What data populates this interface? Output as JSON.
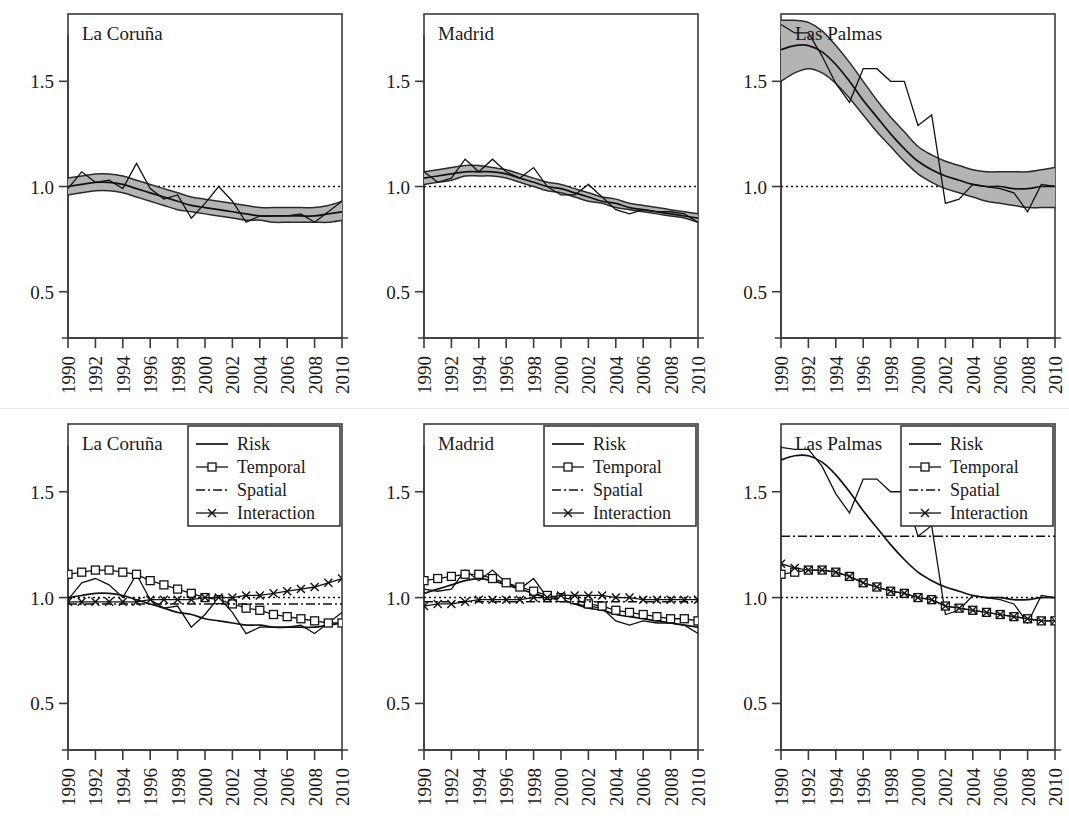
{
  "figure": {
    "width": 1069,
    "height": 830,
    "background": "#ffffff",
    "rows": 2,
    "cols": 3,
    "ink_color": "#111111",
    "band_color": "#b4b4b4",
    "axis_color": "#3b3b3b"
  },
  "axes": {
    "y_ticks": [
      0.5,
      1.0,
      1.5
    ],
    "y_tick_labels": [
      "0.5",
      "1.0",
      "1.5"
    ],
    "ylim": [
      0.28,
      1.82
    ],
    "x_ticks": [
      1990,
      1992,
      1994,
      1996,
      1998,
      2000,
      2002,
      2004,
      2006,
      2008,
      2010
    ],
    "x_tick_labels": [
      "1990",
      "1992",
      "1994",
      "1996",
      "1998",
      "2000",
      "2002",
      "2004",
      "2006",
      "2008",
      "2010"
    ],
    "xlim": [
      1990,
      2010
    ],
    "reference_line": 1.0,
    "grid": false,
    "xlabel": "",
    "ylabel": ""
  },
  "legend": {
    "position": "top-right",
    "visible_in_rows": [
      2
    ],
    "items": [
      {
        "label": "Risk",
        "style": "solid-line",
        "marker": "none"
      },
      {
        "label": "Temporal",
        "style": "solid-line",
        "marker": "square"
      },
      {
        "label": "Spatial",
        "style": "dash-dot-line",
        "marker": "none"
      },
      {
        "label": "Interaction",
        "style": "solid-line",
        "marker": "x"
      }
    ]
  },
  "chart_data": [
    {
      "id": "top-la-coruna",
      "type": "line",
      "title": "La Coruña",
      "row": 1,
      "col": 1,
      "xlabel": "",
      "ylabel": "",
      "ylim": [
        0.28,
        1.82
      ],
      "xlim": [
        1990,
        2010
      ],
      "grid": false,
      "x": [
        1990,
        1991,
        1992,
        1993,
        1994,
        1995,
        1996,
        1997,
        1998,
        1999,
        2000,
        2001,
        2002,
        2003,
        2004,
        2005,
        2006,
        2007,
        2008,
        2009,
        2010
      ],
      "series": [
        {
          "name": "Observed SMR",
          "style": "thin-solid",
          "values": [
            0.99,
            1.07,
            1.02,
            1.03,
            0.99,
            1.11,
            0.99,
            0.94,
            0.96,
            0.85,
            0.92,
            1.0,
            0.93,
            0.83,
            0.86,
            0.86,
            0.86,
            0.87,
            0.83,
            0.88,
            0.93
          ]
        },
        {
          "name": "Smoothed risk",
          "style": "medium-solid",
          "values": [
            1.0,
            1.01,
            1.02,
            1.02,
            1.01,
            0.99,
            0.97,
            0.95,
            0.93,
            0.91,
            0.9,
            0.89,
            0.88,
            0.87,
            0.86,
            0.86,
            0.86,
            0.86,
            0.86,
            0.87,
            0.88
          ]
        }
      ],
      "band": {
        "name": "95% credible interval",
        "fill": "#b4b4b4",
        "lower": [
          0.96,
          0.97,
          0.98,
          0.98,
          0.97,
          0.95,
          0.93,
          0.91,
          0.89,
          0.88,
          0.87,
          0.86,
          0.85,
          0.84,
          0.84,
          0.83,
          0.83,
          0.83,
          0.83,
          0.83,
          0.84
        ],
        "upper": [
          1.04,
          1.05,
          1.06,
          1.06,
          1.05,
          1.03,
          1.01,
          0.99,
          0.97,
          0.95,
          0.94,
          0.93,
          0.92,
          0.91,
          0.9,
          0.9,
          0.9,
          0.9,
          0.9,
          0.91,
          0.93
        ]
      }
    },
    {
      "id": "top-madrid",
      "type": "line",
      "title": "Madrid",
      "row": 1,
      "col": 2,
      "xlabel": "",
      "ylabel": "",
      "ylim": [
        0.28,
        1.82
      ],
      "xlim": [
        1990,
        2010
      ],
      "grid": false,
      "x": [
        1990,
        1991,
        1992,
        1993,
        1994,
        1995,
        1996,
        1997,
        1998,
        1999,
        2000,
        2001,
        2002,
        2003,
        2004,
        2005,
        2006,
        2007,
        2008,
        2009,
        2010
      ],
      "series": [
        {
          "name": "Observed SMR",
          "style": "thin-solid",
          "values": [
            1.07,
            1.02,
            1.04,
            1.13,
            1.07,
            1.13,
            1.07,
            1.04,
            1.09,
            1.0,
            0.96,
            0.96,
            1.01,
            0.95,
            0.89,
            0.87,
            0.89,
            0.88,
            0.88,
            0.87,
            0.83
          ]
        },
        {
          "name": "Smoothed risk",
          "style": "medium-solid",
          "values": [
            1.04,
            1.05,
            1.06,
            1.07,
            1.07,
            1.07,
            1.06,
            1.04,
            1.02,
            1.0,
            0.99,
            0.97,
            0.95,
            0.93,
            0.92,
            0.9,
            0.89,
            0.88,
            0.87,
            0.86,
            0.85
          ]
        }
      ],
      "band": {
        "name": "95% credible interval",
        "fill": "#b4b4b4",
        "lower": [
          1.01,
          1.02,
          1.03,
          1.05,
          1.05,
          1.05,
          1.04,
          1.02,
          1.0,
          0.98,
          0.97,
          0.95,
          0.93,
          0.92,
          0.9,
          0.89,
          0.88,
          0.87,
          0.86,
          0.85,
          0.83
        ],
        "upper": [
          1.07,
          1.08,
          1.09,
          1.1,
          1.1,
          1.09,
          1.08,
          1.06,
          1.04,
          1.02,
          1.01,
          0.99,
          0.97,
          0.95,
          0.94,
          0.92,
          0.91,
          0.9,
          0.89,
          0.88,
          0.87
        ]
      }
    },
    {
      "id": "top-las-palmas",
      "type": "line",
      "title": "Las Palmas",
      "row": 1,
      "col": 3,
      "xlabel": "",
      "ylabel": "",
      "ylim": [
        0.28,
        1.82
      ],
      "xlim": [
        1990,
        2010
      ],
      "grid": false,
      "x": [
        1990,
        1991,
        1992,
        1993,
        1994,
        1995,
        1996,
        1997,
        1998,
        1999,
        2000,
        2001,
        2002,
        2003,
        2004,
        2005,
        2006,
        2007,
        2008,
        2009,
        2010
      ],
      "series": [
        {
          "name": "Observed SMR",
          "style": "thin-solid",
          "values": [
            1.77,
            1.73,
            1.73,
            1.62,
            1.49,
            1.4,
            1.56,
            1.56,
            1.5,
            1.5,
            1.29,
            1.34,
            0.92,
            0.94,
            1.01,
            1.0,
            0.99,
            0.97,
            0.88,
            1.01,
            1.0
          ]
        },
        {
          "name": "Smoothed risk",
          "style": "medium-solid",
          "values": [
            1.65,
            1.67,
            1.67,
            1.64,
            1.58,
            1.5,
            1.41,
            1.33,
            1.25,
            1.18,
            1.12,
            1.08,
            1.05,
            1.03,
            1.01,
            1.0,
            1.0,
            0.99,
            0.99,
            1.0,
            1.0
          ]
        }
      ],
      "band": {
        "name": "95% credible interval",
        "fill": "#b4b4b4",
        "lower": [
          1.5,
          1.54,
          1.56,
          1.54,
          1.49,
          1.42,
          1.34,
          1.26,
          1.19,
          1.12,
          1.06,
          1.02,
          0.99,
          0.97,
          0.95,
          0.93,
          0.92,
          0.91,
          0.9,
          0.9,
          0.9
        ],
        "upper": [
          1.79,
          1.79,
          1.78,
          1.74,
          1.67,
          1.59,
          1.5,
          1.41,
          1.33,
          1.26,
          1.19,
          1.15,
          1.12,
          1.1,
          1.08,
          1.07,
          1.07,
          1.07,
          1.07,
          1.08,
          1.09
        ]
      }
    },
    {
      "id": "bottom-la-coruna",
      "type": "line",
      "title": "La Coruña",
      "row": 2,
      "col": 1,
      "xlabel": "",
      "ylabel": "",
      "ylim": [
        0.28,
        1.82
      ],
      "xlim": [
        1990,
        2010
      ],
      "grid": false,
      "legend": true,
      "x": [
        1990,
        1991,
        1992,
        1993,
        1994,
        1995,
        1996,
        1997,
        1998,
        1999,
        2000,
        2001,
        2002,
        2003,
        2004,
        2005,
        2006,
        2007,
        2008,
        2009,
        2010
      ],
      "series": [
        {
          "name": "Observed SMR",
          "style": "thin-solid",
          "values": [
            0.99,
            1.07,
            1.09,
            1.06,
            1.0,
            1.11,
            0.99,
            0.95,
            0.96,
            0.86,
            0.92,
            1.0,
            0.93,
            0.83,
            0.86,
            0.86,
            0.86,
            0.87,
            0.83,
            0.88,
            0.93
          ]
        },
        {
          "name": "Risk",
          "style": "medium-solid",
          "values": [
            1.0,
            1.01,
            1.02,
            1.02,
            1.01,
            0.99,
            0.97,
            0.95,
            0.93,
            0.92,
            0.9,
            0.89,
            0.88,
            0.87,
            0.87,
            0.86,
            0.86,
            0.86,
            0.86,
            0.87,
            0.88
          ]
        },
        {
          "name": "Temporal",
          "style": "square-marker",
          "values": [
            1.11,
            1.12,
            1.13,
            1.13,
            1.12,
            1.11,
            1.08,
            1.06,
            1.04,
            1.02,
            1.0,
            0.99,
            0.97,
            0.95,
            0.94,
            0.92,
            0.91,
            0.9,
            0.89,
            0.88,
            0.88
          ]
        },
        {
          "name": "Spatial",
          "style": "dash-dot",
          "values": [
            0.97,
            0.97,
            0.97,
            0.97,
            0.97,
            0.97,
            0.97,
            0.97,
            0.97,
            0.97,
            0.97,
            0.97,
            0.97,
            0.97,
            0.97,
            0.97,
            0.97,
            0.97,
            0.97,
            0.97,
            0.97
          ]
        },
        {
          "name": "Interaction",
          "style": "x-marker",
          "values": [
            0.98,
            0.98,
            0.98,
            0.98,
            0.98,
            0.98,
            0.99,
            0.99,
            0.99,
            0.99,
            1.0,
            1.0,
            1.0,
            1.01,
            1.01,
            1.02,
            1.03,
            1.04,
            1.05,
            1.07,
            1.09
          ]
        }
      ]
    },
    {
      "id": "bottom-madrid",
      "type": "line",
      "title": "Madrid",
      "row": 2,
      "col": 2,
      "xlabel": "",
      "ylabel": "",
      "ylim": [
        0.28,
        1.82
      ],
      "xlim": [
        1990,
        2010
      ],
      "grid": false,
      "legend": true,
      "x": [
        1990,
        1991,
        1992,
        1993,
        1994,
        1995,
        1996,
        1997,
        1998,
        1999,
        2000,
        2001,
        2002,
        2003,
        2004,
        2005,
        2006,
        2007,
        2008,
        2009,
        2010
      ],
      "series": [
        {
          "name": "Observed SMR",
          "style": "thin-solid",
          "values": [
            1.04,
            1.03,
            1.04,
            1.13,
            1.08,
            1.13,
            1.07,
            1.04,
            1.09,
            1.0,
            0.99,
            0.97,
            0.96,
            0.95,
            0.89,
            0.87,
            0.89,
            0.88,
            0.88,
            0.87,
            0.83
          ]
        },
        {
          "name": "Risk",
          "style": "medium-solid",
          "values": [
            1.02,
            1.04,
            1.06,
            1.08,
            1.09,
            1.08,
            1.06,
            1.04,
            1.02,
            1.0,
            0.99,
            0.97,
            0.95,
            0.94,
            0.92,
            0.91,
            0.9,
            0.89,
            0.88,
            0.87,
            0.86
          ]
        },
        {
          "name": "Temporal",
          "style": "square-marker",
          "values": [
            1.08,
            1.09,
            1.1,
            1.11,
            1.11,
            1.09,
            1.07,
            1.05,
            1.03,
            1.01,
            1.0,
            0.99,
            0.97,
            0.96,
            0.94,
            0.93,
            0.92,
            0.91,
            0.9,
            0.9,
            0.89
          ]
        },
        {
          "name": "Spatial",
          "style": "dash-dot",
          "values": [
            0.98,
            0.98,
            0.98,
            0.98,
            0.98,
            0.98,
            0.98,
            0.98,
            0.98,
            0.98,
            0.98,
            0.98,
            0.98,
            0.98,
            0.98,
            0.98,
            0.98,
            0.98,
            0.98,
            0.98,
            0.98
          ]
        },
        {
          "name": "Interaction",
          "style": "x-marker",
          "values": [
            0.96,
            0.97,
            0.97,
            0.98,
            0.99,
            0.99,
            0.99,
            0.99,
            1.0,
            1.0,
            1.01,
            1.01,
            1.01,
            1.01,
            1.0,
            1.0,
            0.99,
            0.99,
            0.99,
            0.99,
            0.99
          ]
        }
      ]
    },
    {
      "id": "bottom-las-palmas",
      "type": "line",
      "title": "Las Palmas",
      "row": 2,
      "col": 3,
      "xlabel": "",
      "ylabel": "",
      "ylim": [
        0.28,
        1.82
      ],
      "xlim": [
        1990,
        2010
      ],
      "grid": false,
      "legend": true,
      "x": [
        1990,
        1991,
        1992,
        1993,
        1994,
        1995,
        1996,
        1997,
        1998,
        1999,
        2000,
        2001,
        2002,
        2003,
        2004,
        2005,
        2006,
        2007,
        2008,
        2009,
        2010
      ],
      "series": [
        {
          "name": "Observed SMR",
          "style": "thin-solid",
          "values": [
            1.71,
            1.7,
            1.7,
            1.62,
            1.49,
            1.4,
            1.56,
            1.56,
            1.5,
            1.5,
            1.29,
            1.34,
            0.92,
            0.94,
            1.01,
            1.0,
            0.99,
            0.97,
            0.88,
            1.01,
            1.0
          ]
        },
        {
          "name": "Risk",
          "style": "medium-solid",
          "values": [
            1.65,
            1.67,
            1.67,
            1.64,
            1.58,
            1.5,
            1.41,
            1.33,
            1.25,
            1.18,
            1.12,
            1.08,
            1.05,
            1.03,
            1.01,
            1.0,
            1.0,
            0.99,
            0.99,
            1.0,
            1.0
          ]
        },
        {
          "name": "Temporal",
          "style": "square-marker",
          "values": [
            1.11,
            1.12,
            1.13,
            1.13,
            1.12,
            1.1,
            1.07,
            1.05,
            1.03,
            1.02,
            1.0,
            0.99,
            0.96,
            0.95,
            0.94,
            0.93,
            0.92,
            0.91,
            0.9,
            0.89,
            0.89
          ]
        },
        {
          "name": "Spatial",
          "style": "dash-dot",
          "values": [
            1.29,
            1.29,
            1.29,
            1.29,
            1.29,
            1.29,
            1.29,
            1.29,
            1.29,
            1.29,
            1.29,
            1.29,
            1.29,
            1.29,
            1.29,
            1.29,
            1.29,
            1.29,
            1.29,
            1.29,
            1.29
          ]
        },
        {
          "name": "Interaction",
          "style": "x-marker",
          "values": [
            1.16,
            1.14,
            1.13,
            1.13,
            1.12,
            1.1,
            1.07,
            1.05,
            1.03,
            1.02,
            1.0,
            0.99,
            0.96,
            0.95,
            0.94,
            0.93,
            0.92,
            0.91,
            0.9,
            0.89,
            0.89
          ]
        }
      ]
    }
  ]
}
